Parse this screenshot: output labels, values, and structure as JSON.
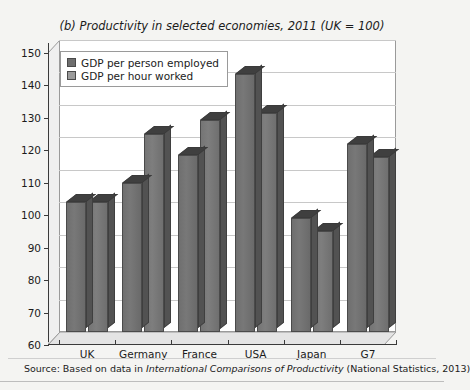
{
  "figure": {
    "title": "(b) Productivity in selected economies, 2011 (UK = 100)",
    "source_prefix": "Source: Based on data in ",
    "source_italic": "International Comparisons of Productivity",
    "source_suffix": " (National Statistics, 2013)",
    "bleed_text": ""
  },
  "chart_data": {
    "type": "bar",
    "title": "(b) Productivity in selected economies, 2011 (UK = 100)",
    "xlabel": "",
    "ylabel": "",
    "ylim": [
      60,
      150
    ],
    "ytick_step": 10,
    "yticks": [
      150,
      140,
      130,
      120,
      110,
      100,
      90,
      80,
      70,
      60
    ],
    "grid": true,
    "legend_position": "top-left-inside",
    "categories": [
      "UK",
      "Germany",
      "France",
      "USA",
      "Japan",
      "G7"
    ],
    "series": [
      {
        "name": "GDP per person employed",
        "color": "#6e6e6e",
        "values": [
          100,
          106,
          114.5,
          139.5,
          95,
          118
        ]
      },
      {
        "name": "GDP per hour worked",
        "color": "#9b9b9b",
        "values": [
          100,
          121,
          125.5,
          127.5,
          91,
          114
        ]
      }
    ]
  }
}
